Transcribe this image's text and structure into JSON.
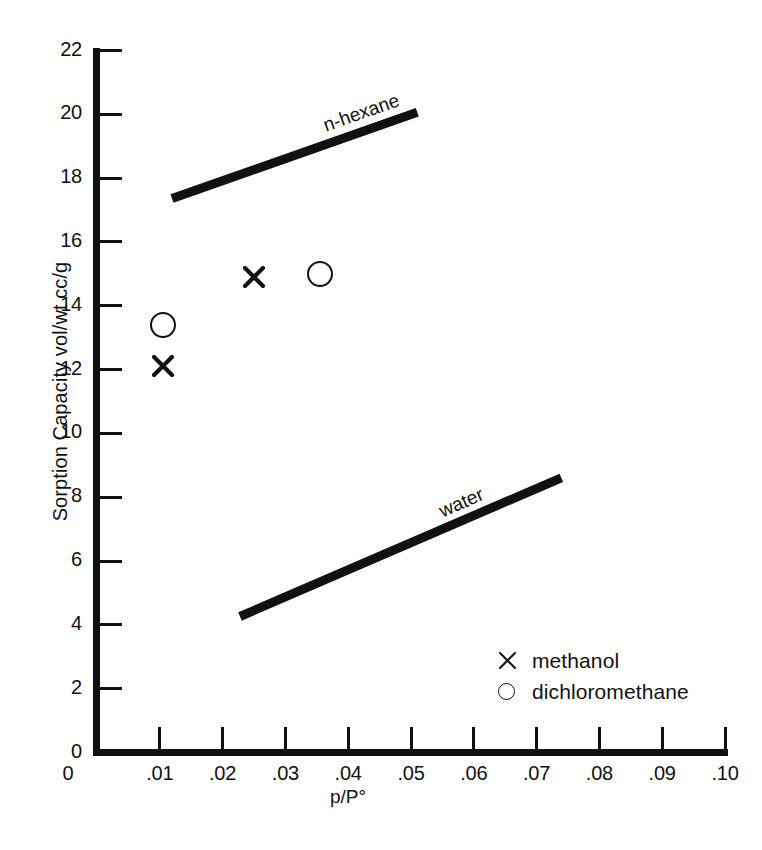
{
  "chart_data": {
    "type": "scatter",
    "title": "",
    "xlabel": "p/P°",
    "ylabel": "Sorption Capacity vol/wt cc/g",
    "xlim": [
      0,
      0.1
    ],
    "ylim": [
      0,
      22
    ],
    "grid": false,
    "legend_position": "inside-lower-right",
    "x_ticks": [
      {
        "value": 0.01,
        "label": ".01"
      },
      {
        "value": 0.02,
        "label": ".02"
      },
      {
        "value": 0.03,
        "label": ".03"
      },
      {
        "value": 0.04,
        "label": ".04"
      },
      {
        "value": 0.05,
        "label": ".05"
      },
      {
        "value": 0.06,
        "label": ".06"
      },
      {
        "value": 0.07,
        "label": ".07"
      },
      {
        "value": 0.08,
        "label": ".08"
      },
      {
        "value": 0.09,
        "label": ".09"
      },
      {
        "value": 0.1,
        "label": ".10"
      }
    ],
    "x_origin_label": "0",
    "y_ticks": [
      {
        "value": 0,
        "label": "0"
      },
      {
        "value": 2,
        "label": "2"
      },
      {
        "value": 4,
        "label": "4"
      },
      {
        "value": 6,
        "label": "6"
      },
      {
        "value": 8,
        "label": "8"
      },
      {
        "value": 10,
        "label": "10"
      },
      {
        "value": 12,
        "label": "12"
      },
      {
        "value": 14,
        "label": "14"
      },
      {
        "value": 16,
        "label": "16"
      },
      {
        "value": 18,
        "label": "18"
      },
      {
        "value": 20,
        "label": "20"
      },
      {
        "value": 22,
        "label": "22"
      }
    ],
    "series": [
      {
        "name": "methanol",
        "marker": "x",
        "points": [
          {
            "x": 0.0105,
            "y": 12.1
          },
          {
            "x": 0.025,
            "y": 14.9
          }
        ]
      },
      {
        "name": "dichloromethane",
        "marker": "circle",
        "points": [
          {
            "x": 0.0105,
            "y": 13.4
          },
          {
            "x": 0.0355,
            "y": 15.0
          }
        ]
      }
    ],
    "trend_bands": [
      {
        "name": "n-hexane",
        "label": "n-hexane",
        "x_start": 0.012,
        "y_start": 17.35,
        "x_end": 0.051,
        "y_end": 20.05
      },
      {
        "name": "water",
        "label": "water",
        "x_start": 0.0228,
        "y_start": 4.25,
        "x_end": 0.074,
        "y_end": 8.6
      }
    ],
    "legend": [
      {
        "symbol": "x",
        "label": "methanol"
      },
      {
        "symbol": "circle",
        "label": "dichloromethane"
      }
    ],
    "colors": {
      "ink": "#111111",
      "background": "#ffffff"
    }
  }
}
